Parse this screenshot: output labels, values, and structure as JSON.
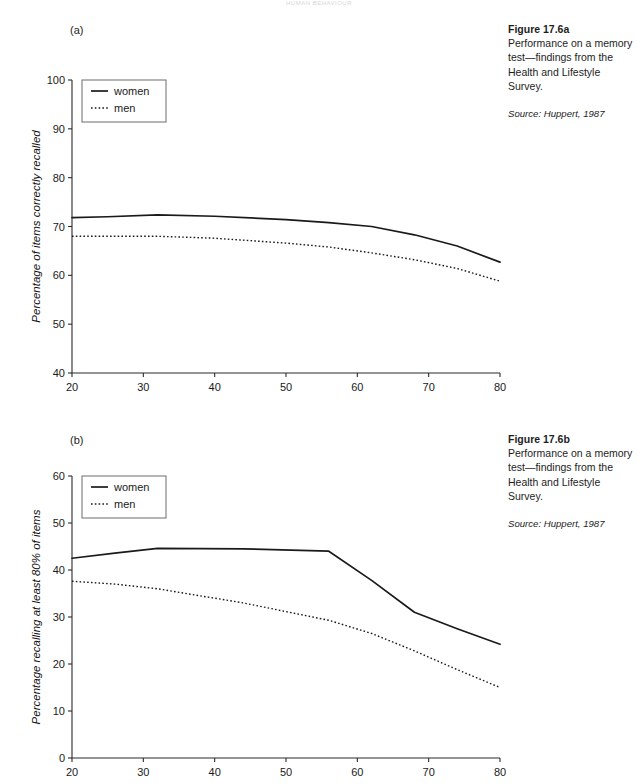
{
  "header": {
    "running_head": "HUMAN BEHAVIOUR"
  },
  "figures": [
    {
      "panel_label": "(a)",
      "caption_title": "Figure 17.6a",
      "caption_body": "Performance on a memory test—findings from the Health and Lifestyle Survey.",
      "caption_source": "Source: Huppert, 1987"
    },
    {
      "panel_label": "(b)",
      "caption_title": "Figure 17.6b",
      "caption_body": "Performance on a memory test—findings from the Health and Lifestyle Survey.",
      "caption_source": "Source: Huppert, 1987"
    }
  ],
  "chart_data": [
    {
      "type": "line",
      "title": "",
      "panel": "(a)",
      "xlabel": "Age (group midpoint)",
      "ylabel": "Percentage of items correctly recalled",
      "xlim": [
        20,
        80
      ],
      "ylim": [
        40,
        100
      ],
      "xticks": [
        20,
        30,
        40,
        50,
        60,
        70,
        80
      ],
      "yticks": [
        40,
        50,
        60,
        70,
        80,
        90,
        100
      ],
      "xtick_labels": [
        "20",
        "30",
        "40",
        "50",
        "60",
        "70",
        "80"
      ],
      "ytick_labels": [
        "40",
        "50",
        "60",
        "70",
        "80",
        "90",
        "100"
      ],
      "grid": false,
      "legend_position": "top-left",
      "x": [
        20,
        25,
        32,
        40,
        50,
        56,
        62,
        68,
        74,
        80
      ],
      "series": [
        {
          "name": "women",
          "style": "solid",
          "values": [
            71.8,
            72.0,
            72.4,
            72.1,
            71.4,
            70.8,
            70.0,
            68.3,
            66.0,
            62.7
          ]
        },
        {
          "name": "men",
          "style": "dotted",
          "values": [
            68.0,
            68.0,
            68.0,
            67.6,
            66.6,
            65.8,
            64.6,
            63.2,
            61.4,
            58.8
          ]
        }
      ]
    },
    {
      "type": "line",
      "title": "",
      "panel": "(b)",
      "xlabel": "",
      "ylabel": "Percentage recalling at least 80% of items",
      "xlim": [
        20,
        80
      ],
      "ylim": [
        0,
        60
      ],
      "xticks": [
        20,
        30,
        40,
        50,
        60,
        70,
        80
      ],
      "yticks": [
        0,
        10,
        20,
        30,
        40,
        50,
        60
      ],
      "xtick_labels": [
        "20",
        "30",
        "40",
        "50",
        "60",
        "70",
        "80"
      ],
      "ytick_labels": [
        "0",
        "10",
        "20",
        "30",
        "40",
        "50",
        "60"
      ],
      "grid": false,
      "legend_position": "top-left",
      "x": [
        20,
        26,
        32,
        44,
        56,
        62,
        68,
        74,
        80
      ],
      "series": [
        {
          "name": "women",
          "style": "solid",
          "values": [
            42.5,
            43.6,
            44.6,
            44.5,
            44.0,
            37.8,
            31.0,
            27.5,
            24.2
          ]
        },
        {
          "name": "men",
          "style": "dotted",
          "values": [
            37.6,
            37.0,
            36.0,
            33.0,
            29.3,
            26.5,
            22.8,
            18.8,
            15.0
          ]
        }
      ]
    }
  ]
}
